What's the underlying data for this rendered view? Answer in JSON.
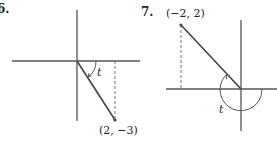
{
  "figures": [
    {
      "number": "6.",
      "point_label": "(2, −3)",
      "angle_label": "t"
    },
    {
      "number": "7.",
      "point_label": "(−2, 2)",
      "angle_label": "t"
    }
  ],
  "colors": {
    "line": "#444444",
    "dashed": "#777777",
    "text": "#222222"
  }
}
